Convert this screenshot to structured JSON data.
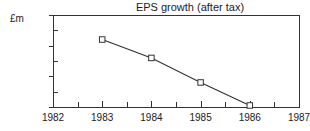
{
  "chart_data": {
    "type": "line",
    "title": "EPS growth (after tax)",
    "xlabel": "",
    "ylabel": "£m",
    "x": [
      1983,
      1984,
      1985,
      1986
    ],
    "values": [
      22,
      16,
      8,
      0.5
    ],
    "series": [
      {
        "name": "EPS growth (after tax)",
        "x": [
          1983,
          1984,
          1985,
          1986
        ],
        "values": [
          22,
          16,
          8,
          0.5
        ]
      }
    ],
    "xlim": [
      1982,
      1987
    ],
    "ylim": [
      0,
      30
    ],
    "x_ticks": [
      1982,
      1983,
      1984,
      1985,
      1986,
      1987
    ],
    "x_tick_labels": [
      "1982",
      "1983",
      "1984",
      "1985",
      "1986",
      "1987"
    ],
    "x_minor_ticks": [
      1982.5,
      1983.5,
      1984.5,
      1985.5,
      1986.5
    ],
    "y_ticks": [
      0,
      10,
      20,
      30
    ],
    "y_tick_labels": [
      "0",
      "10",
      "20",
      "30"
    ],
    "y_minor_ticks": [
      5,
      15,
      25
    ],
    "grid": false,
    "legend": false,
    "marker": "open-square",
    "line_color": "#333333",
    "marker_face_color": "#ffffff",
    "marker_edge_color": "#333333",
    "axis_color": "#333333",
    "background": "#ffffff"
  },
  "axis_label": "£m",
  "y_axis_corner_label": "£m 30"
}
